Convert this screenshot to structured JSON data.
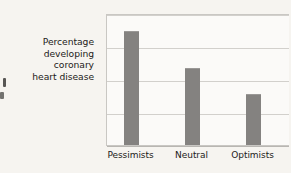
{
  "chart_data": {
    "type": "bar",
    "title": "",
    "subtitle": "",
    "xlabel": "",
    "ylabel": "Percentage developing coronary heart disease",
    "ylabel_lines": [
      "Percentage",
      "developing",
      "coronary",
      "heart disease"
    ],
    "categories": [
      "Pessimists",
      "Neutral",
      "Optimists"
    ],
    "values": [
      17.2,
      11.7,
      7.8
    ],
    "ylim": [
      0,
      20
    ],
    "yticks": [
      0,
      5,
      10,
      15,
      20
    ],
    "ytick_labels": [
      "0",
      "5",
      "10",
      "15",
      "20%"
    ],
    "grid": true,
    "legend": false,
    "legend_position": "none",
    "series": [
      {
        "name": "Percentage developing coronary heart disease",
        "values": [
          17.2,
          11.7,
          7.8
        ]
      }
    ],
    "colors": {
      "bar": "#848280",
      "gridline": "#d2d0cc",
      "axis": "#c9c7c3",
      "text": "#1d1b19",
      "background": "#f6f4f0",
      "plot_background": "#fbfaf8"
    }
  }
}
